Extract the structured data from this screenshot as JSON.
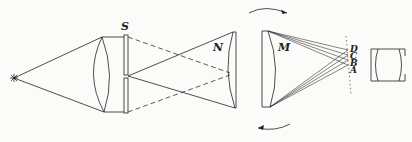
{
  "diagram": {
    "labels": {
      "slit": "S",
      "n": "N",
      "m": "M",
      "d": "D",
      "c": "C",
      "b": "B",
      "a": "A"
    },
    "elements": [
      {
        "name": "light-source",
        "symbol": "*"
      },
      {
        "name": "condenser-lens"
      },
      {
        "name": "slit",
        "label": "S"
      },
      {
        "name": "lens-n",
        "label": "N"
      },
      {
        "name": "mirror-m",
        "label": "M"
      },
      {
        "name": "focal-line",
        "points": [
          "D",
          "C",
          "B",
          "A"
        ]
      },
      {
        "name": "eyepiece"
      },
      {
        "name": "rotation-arrow-top",
        "direction": "clockwise"
      },
      {
        "name": "rotation-arrow-bottom",
        "direction": "clockwise"
      }
    ],
    "colors": {
      "ink": "#222222",
      "paper": "#fbfbf9"
    }
  }
}
